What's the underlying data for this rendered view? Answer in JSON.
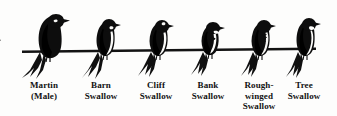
{
  "plate": {
    "title": "Swallows perched on a wire",
    "background_color": "#fdfdfc",
    "ink_color": "#111111",
    "wire": {
      "name": "telephone wire",
      "x_start": 22,
      "x_end": 316,
      "y": 49,
      "thickness": 2.4
    }
  },
  "birds": [
    {
      "id": "martin-male",
      "common_name": "Martin",
      "qualifier": "(Male)",
      "label_lines": [
        "Martin",
        "(Male)"
      ],
      "plumage": "solid glossy black, no pale underparts",
      "size_rank": 1,
      "center_x": 44,
      "label_center_x": 44
    },
    {
      "id": "barn-swallow",
      "common_name": "Barn Swallow",
      "qualifier": "",
      "label_lines": [
        "Barn",
        "Swallow"
      ],
      "plumage": "dark back, pale throat, deeply forked long tail",
      "size_rank": 3,
      "center_x": 103,
      "label_center_x": 101
    },
    {
      "id": "cliff-swallow",
      "common_name": "Cliff Swallow",
      "qualifier": "",
      "label_lines": [
        "Cliff",
        "Swallow"
      ],
      "plumage": "dark back, pale underparts, square tail",
      "size_rank": 4,
      "center_x": 156,
      "label_center_x": 156
    },
    {
      "id": "bank-swallow",
      "common_name": "Bank Swallow",
      "qualifier": "",
      "label_lines": [
        "Bank",
        "Swallow"
      ],
      "plumage": "white underparts with dark breast band",
      "size_rank": 6,
      "center_x": 208,
      "label_center_x": 208
    },
    {
      "id": "rough-winged-swallow",
      "common_name": "Rough-winged Swallow",
      "qualifier": "",
      "label_lines": [
        "Rough-",
        "winged",
        "Swallow"
      ],
      "plumage": "dusky mottled throat and breast",
      "size_rank": 5,
      "center_x": 258,
      "label_center_x": 259
    },
    {
      "id": "tree-swallow",
      "common_name": "Tree Swallow",
      "qualifier": "",
      "label_lines": [
        "Tree",
        "Swallow"
      ],
      "plumage": "dark back, clean white underparts",
      "size_rank": 2,
      "center_x": 303,
      "label_center_x": 304
    }
  ]
}
